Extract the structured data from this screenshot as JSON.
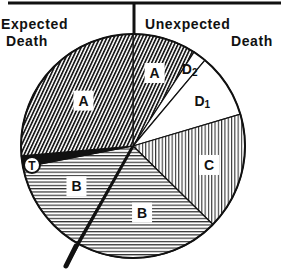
{
  "header": {
    "left_line1": "Expected",
    "left_line2": "Death",
    "right_line1": "Unexpected",
    "right_line2": "Death"
  },
  "chart_data": {
    "type": "pie",
    "title": "",
    "start_angle_deg": 90,
    "direction": "clockwise",
    "divider": "vertical line at 12 o'clock separating Expected Death (left) from Unexpected Death (right)",
    "slices": [
      {
        "label": "A",
        "group": "Unexpected Death",
        "degrees": 33,
        "percent": 9.2,
        "pattern": "diagonal-dense"
      },
      {
        "label": "D2",
        "group": "Unexpected Death",
        "degrees": 7,
        "percent": 1.9,
        "pattern": "blank"
      },
      {
        "label": "D1",
        "group": "Unexpected Death",
        "degrees": 33.5,
        "percent": 9.3,
        "pattern": "blank"
      },
      {
        "label": "C",
        "group": "Unexpected Death",
        "degrees": 61,
        "percent": 17.0,
        "pattern": "vertical-lines"
      },
      {
        "label": "B",
        "group": "Unexpected Death",
        "degrees": 75.5,
        "percent": 21.0,
        "pattern": "horizontal-lines"
      },
      {
        "label": "B",
        "group": "Expected Death",
        "degrees": 49,
        "percent": 13.6,
        "pattern": "horizontal-lines"
      },
      {
        "label": "T",
        "group": "Expected Death",
        "degrees": 6,
        "percent": 1.7,
        "pattern": "solid-black"
      },
      {
        "label": "A",
        "group": "Expected Death",
        "degrees": 95,
        "percent": 26.4,
        "pattern": "diagonal-dense"
      }
    ],
    "labels": [
      "A",
      "D2",
      "D1",
      "C",
      "B",
      "B",
      "T",
      "A"
    ],
    "legend": [
      "Expected Death",
      "Unexpected Death"
    ]
  },
  "colors": {
    "ink": "#111111",
    "paper": "#ffffff"
  }
}
